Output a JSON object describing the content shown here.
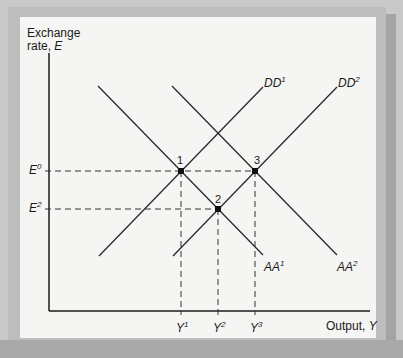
{
  "y_axis": {
    "label_line1": "Exchange",
    "label_line2_prefix": "rate, ",
    "label_line2_var": "E"
  },
  "x_axis": {
    "label_prefix": "Output, ",
    "label_var": "Y"
  },
  "y_ticks": [
    {
      "base": "E",
      "sup": "0"
    },
    {
      "base": "E",
      "sup": "2"
    }
  ],
  "x_ticks": [
    {
      "base": "Y",
      "sup": "1"
    },
    {
      "base": "Y",
      "sup": "2"
    },
    {
      "base": "Y",
      "sup": "3"
    }
  ],
  "curves": {
    "DD1": {
      "base": "DD",
      "sup": "1"
    },
    "DD2": {
      "base": "DD",
      "sup": "2"
    },
    "AA1": {
      "base": "AA",
      "sup": "1"
    },
    "AA2": {
      "base": "AA",
      "sup": "2"
    }
  },
  "points": {
    "p1": "1",
    "p2": "2",
    "p3": "3"
  },
  "colors": {
    "line": "#2a2a2a",
    "background": "#f5f5f3",
    "frame": "#bdbdbd"
  }
}
